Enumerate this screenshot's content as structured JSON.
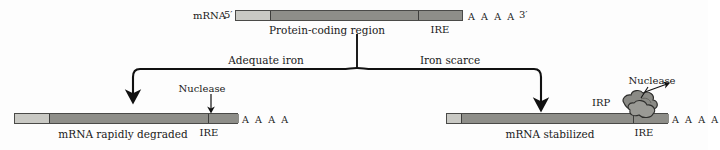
{
  "figure": {
    "colors": {
      "utr": "#c9c9c4",
      "coding": "#8e8e89",
      "outline": "#4a4a48",
      "blob": "#8a8a85",
      "text": "#1a1a1a"
    }
  },
  "top": {
    "mrna_label": "mRNA",
    "five_prime": "5′",
    "three_prime": "3′",
    "coding_label": "Protein-coding region",
    "ire_label": "IRE",
    "polya": "A A A A"
  },
  "branches": {
    "left": {
      "label": "Adequate iron"
    },
    "right": {
      "label": "Iron scarce"
    }
  },
  "left_outcome": {
    "caption": "mRNA rapidly degraded",
    "ire_label": "IRE",
    "nuclease_label": "Nuclease",
    "polya": "A A A A"
  },
  "right_outcome": {
    "caption": "mRNA stabilized",
    "ire_label": "IRE",
    "irp_label": "IRP",
    "nuclease_label": "Nuclease",
    "polya": "A A A A"
  }
}
